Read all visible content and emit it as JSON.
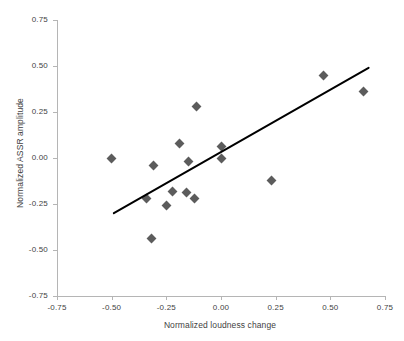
{
  "chart_data": {
    "type": "scatter",
    "title": "",
    "xlabel": "Normalized loudness change",
    "ylabel": "Normalized ASSR amplitude",
    "xlim": [
      -0.75,
      0.75
    ],
    "ylim": [
      -0.75,
      0.75
    ],
    "xticks": [
      "-0.75",
      "-0.50",
      "-0.25",
      "0.00",
      "0.25",
      "0.50",
      "0.75"
    ],
    "xtick_values": [
      -0.75,
      -0.5,
      -0.25,
      0,
      0.25,
      0.5,
      0.75
    ],
    "yticks": [
      "0.75",
      "0.50",
      "0.25",
      "0.00",
      "-0.25",
      "-0.50",
      "-0.75"
    ],
    "ytick_values": [
      0.75,
      0.5,
      0.25,
      0,
      -0.25,
      -0.5,
      -0.75
    ],
    "grid": false,
    "legend": false,
    "marker_shape": "diamond",
    "marker_color": "#5c5c5c",
    "axis_color": "#b5b5b5",
    "text_color": "#3f3f3f",
    "points": [
      {
        "x": -0.5,
        "y": 0.0
      },
      {
        "x": -0.34,
        "y": -0.22
      },
      {
        "x": -0.32,
        "y": -0.44
      },
      {
        "x": -0.31,
        "y": -0.04
      },
      {
        "x": -0.25,
        "y": -0.26
      },
      {
        "x": -0.22,
        "y": -0.18
      },
      {
        "x": -0.19,
        "y": 0.08
      },
      {
        "x": -0.16,
        "y": -0.19
      },
      {
        "x": -0.15,
        "y": -0.02
      },
      {
        "x": -0.12,
        "y": -0.22
      },
      {
        "x": -0.11,
        "y": 0.28
      },
      {
        "x": 0.0,
        "y": 0.06
      },
      {
        "x": 0.0,
        "y": 0.0
      },
      {
        "x": 0.23,
        "y": -0.12
      },
      {
        "x": 0.47,
        "y": 0.45
      },
      {
        "x": 0.65,
        "y": 0.36
      }
    ],
    "trendline": {
      "type": "linear",
      "color": "#000000",
      "width": 2,
      "x0": -0.49,
      "y0": -0.3,
      "x1": 0.675,
      "y1": 0.49
    }
  }
}
